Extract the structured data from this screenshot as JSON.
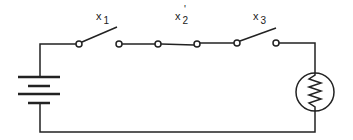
{
  "diagram": {
    "type": "series circuit",
    "components": [
      {
        "id": "battery",
        "kind": "battery"
      },
      {
        "id": "x1",
        "kind": "switch",
        "state": "open",
        "label": "x",
        "subscript": "1",
        "prime": ""
      },
      {
        "id": "x2prime",
        "kind": "switch",
        "state": "closed",
        "label": "x",
        "subscript": "2",
        "prime": "'"
      },
      {
        "id": "x3",
        "kind": "switch",
        "state": "open",
        "label": "x",
        "subscript": "3",
        "prime": ""
      },
      {
        "id": "lamp",
        "kind": "lamp"
      }
    ],
    "line_color": "#222222"
  }
}
